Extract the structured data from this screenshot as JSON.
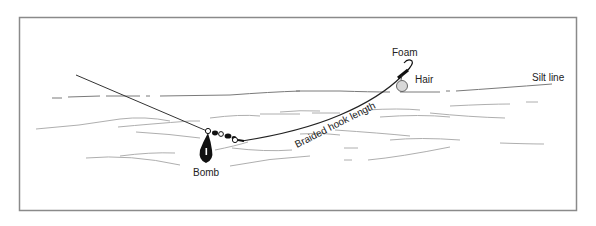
{
  "diagram": {
    "title": "",
    "labels": {
      "foam": "Foam",
      "hair": "Hair",
      "silt_line": "Silt line",
      "braided_hook_length": "Braided hook length",
      "bomb": "Bomb"
    },
    "colors": {
      "frame": "#8a8a8a",
      "line": "#333333",
      "silt": "#9a9a9a",
      "bomb": "#111111",
      "bait": "#d8d8d8"
    }
  }
}
